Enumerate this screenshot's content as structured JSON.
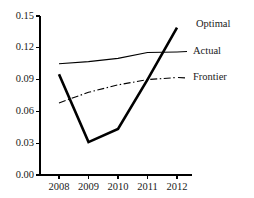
{
  "chart_data": {
    "type": "line",
    "title": "",
    "subtitle": "",
    "xlabel": "",
    "ylabel": "",
    "x": [
      2008,
      2009,
      2010,
      2011,
      2012
    ],
    "categories": [
      "2008",
      "2009",
      "2010",
      "2011",
      "2012"
    ],
    "xlim": [
      2008,
      2012
    ],
    "ylim": [
      0.0,
      0.15
    ],
    "y_ticks": [
      0.0,
      0.03,
      0.06,
      0.09,
      0.12,
      0.15
    ],
    "y_tick_labels": [
      "0.00",
      "0.03",
      "0.06",
      "0.09",
      "0.12",
      "0.15"
    ],
    "x_ticks": [
      2008,
      2009,
      2010,
      2011,
      2012
    ],
    "x_tick_labels": [
      "2008",
      "2009",
      "2010",
      "2011",
      "2012"
    ],
    "grid": false,
    "legend_position": "inline-right",
    "series": [
      {
        "name": "Optimal",
        "values": [
          0.095,
          0.031,
          0.0435,
          0.09,
          0.139
        ],
        "style": "solid",
        "width": 2.6,
        "color": "#000000",
        "label_x": 2012,
        "label_y": 0.1415
      },
      {
        "name": "Actual",
        "values": [
          0.105,
          0.107,
          0.11,
          0.1155,
          0.116
        ],
        "style": "solid",
        "width": 1.1,
        "color": "#000000",
        "label_x": 2012,
        "label_y": 0.1165
      },
      {
        "name": "Frontier",
        "values": [
          0.068,
          0.078,
          0.085,
          0.09,
          0.092
        ],
        "style": "dashdot",
        "width": 1.1,
        "color": "#000000",
        "label_x": 2012,
        "label_y": 0.0915
      }
    ]
  },
  "axes": {
    "axis_color": "#000000",
    "background": "#ffffff"
  }
}
